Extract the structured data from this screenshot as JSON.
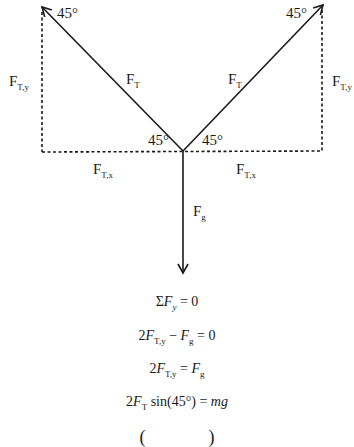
{
  "diagram": {
    "colors": {
      "line": "#1a1a1a",
      "background": "#ffffff"
    },
    "labels": {
      "angle_top_left": "45°",
      "angle_top_right": "45°",
      "angle_bottom_left": "45°",
      "angle_bottom_right": "45°",
      "tension_left": {
        "main": "F",
        "sub": "T"
      },
      "tension_right": {
        "main": "F",
        "sub": "T"
      },
      "tension_y_left": {
        "main": "F",
        "sub": "T,y"
      },
      "tension_y_right": {
        "main": "F",
        "sub": "T,y"
      },
      "tension_x_left": {
        "main": "F",
        "sub": "T,x"
      },
      "tension_x_right": {
        "main": "F",
        "sub": "T,x"
      },
      "gravity": {
        "main": "F",
        "sub": "g"
      }
    }
  },
  "equations": {
    "eq1": {
      "sigma": "Σ",
      "F": "F",
      "sub": "y",
      "rest": " = 0"
    },
    "eq2": {
      "coef": "2",
      "F1": "F",
      "sub1": "T,y",
      "minus": " − ",
      "F2": "F",
      "sub2": "g",
      "rest": " = 0"
    },
    "eq3": {
      "coef": "2",
      "F1": "F",
      "sub1": "T,y",
      "eq": " = ",
      "F2": "F",
      "sub2": "g"
    },
    "eq4": {
      "coef": "2",
      "F1": "F",
      "sub1": "T",
      "func": " sin(45°) = ",
      "rhs": "mg"
    },
    "eq5_partial": {
      "text": "(              )"
    }
  }
}
